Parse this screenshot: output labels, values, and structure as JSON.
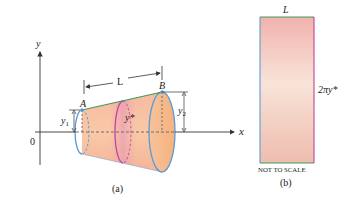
{
  "figure_a": {
    "axis_y_label": "y",
    "axis_x_label": "x",
    "origin_label": "0",
    "point_a": "A",
    "point_b": "B",
    "length_label": "L",
    "y1_label": "y",
    "y1_sub": "1",
    "y2_label": "y",
    "y2_sub": "2",
    "ystar_label": "y*",
    "caption": "(a)"
  },
  "figure_b": {
    "top_label": "L",
    "side_label": "2πy*",
    "note": "NOT TO SCALE",
    "caption": "(b)"
  },
  "colors": {
    "cone_fill_light": "#f9c8a6",
    "cone_fill_dark": "#f3a98a",
    "ellipse_stroke": "#5b9bd5",
    "mid_ring": "#c1449a",
    "slant_edge": "#3e9b5a",
    "rect_top": "#f2b8b4",
    "rect_mid": "#f8e1d6",
    "rect_bottom": "#efc0b1"
  }
}
